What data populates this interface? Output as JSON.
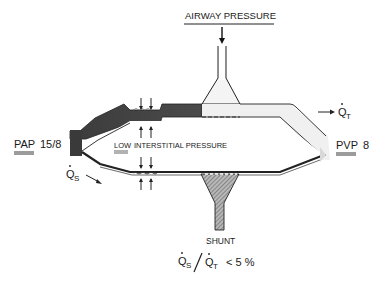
{
  "diagram": {
    "labels": {
      "airway_pressure": "AIRWAY PRESSURE",
      "pap": "PAP",
      "pap_value": "15/8",
      "pvp": "PVP",
      "pvp_value": "8",
      "low": "LOW",
      "interstitial_pressure": "INTERSTITIAL PRESSURE",
      "qs": "Q",
      "qs_sub": "S",
      "qt": "Q",
      "qt_sub": "T",
      "shunt": "SHUNT",
      "ratio_num": "Q",
      "ratio_num_sub": "S",
      "ratio_den": "Q",
      "ratio_den_sub": "T",
      "ratio_value": "< 5 %"
    },
    "colors": {
      "arterial_vessel": "#3a3a3a",
      "venous_vessel": "#f2f2f2",
      "outline": "#1a1a1a",
      "shunt_hatch": "#8a8a8a",
      "background": "#ffffff"
    }
  }
}
